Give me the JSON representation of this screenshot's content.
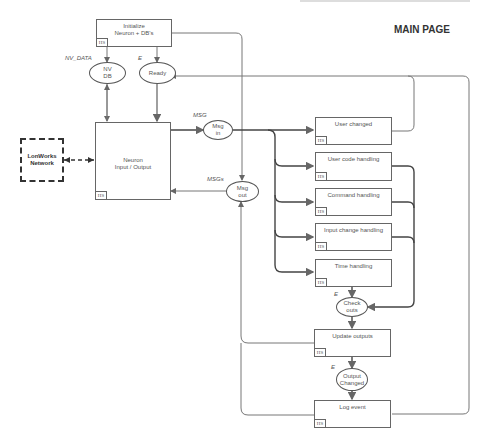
{
  "page": {
    "title": "MAIN PAGE"
  },
  "network": {
    "label": "LonWorks\nNetwork"
  },
  "boxes": {
    "initialize": {
      "label": "Initialize\nNeuron + DB's",
      "hs": "HS"
    },
    "neuron": {
      "label": "Neuron\nInput / Output",
      "hs": "HS"
    },
    "user_changed": {
      "label": "User changed",
      "hs": "HS"
    },
    "user_code": {
      "label": "User code handling",
      "hs": "HS"
    },
    "command": {
      "label": "Command handling",
      "hs": "HS"
    },
    "input_change": {
      "label": "Input change handling",
      "hs": "HS"
    },
    "time": {
      "label": "Time handling",
      "hs": "HS"
    },
    "update_outputs": {
      "label": "Update outputs",
      "hs": "HS"
    },
    "log_event": {
      "label": "Log event",
      "hs": "HS"
    }
  },
  "ellipses": {
    "nv_db": {
      "label": "NV\nDB",
      "tag": "NV_DATA"
    },
    "ready": {
      "label": "Ready",
      "tag": "E"
    },
    "msg_in": {
      "label": "Msg\nin",
      "tag": "MSG"
    },
    "msg_out": {
      "label": "Msg\nout",
      "tag": "MSGs"
    },
    "check_outs": {
      "label": "Check\nouts",
      "tag": "E"
    },
    "output_changed": {
      "label": "Output\nChanged",
      "tag": "E"
    }
  },
  "colors": {
    "line": "#666666",
    "thick_line": "#444444",
    "dashed": "#333333"
  }
}
